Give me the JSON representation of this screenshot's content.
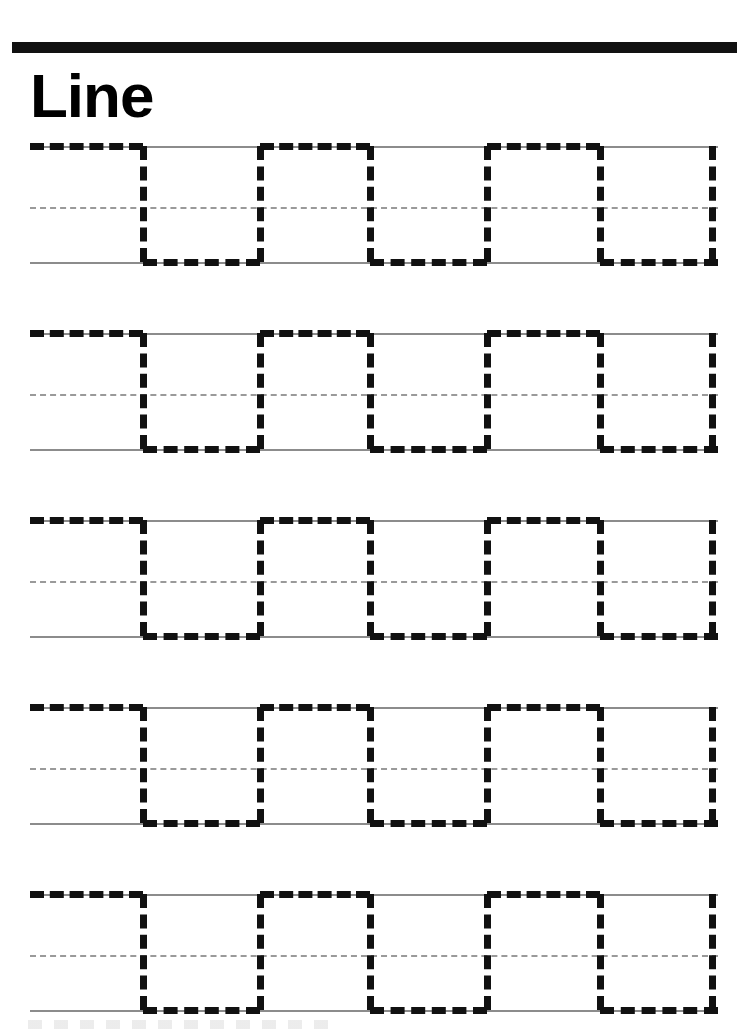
{
  "worksheet": {
    "title": "Line",
    "type": "handwriting-tracing-worksheet",
    "pattern_name": "square-wave-line",
    "page_width": 749,
    "page_height": 1034
  },
  "header": {
    "bar_color": "#111111",
    "title_color": "#000000"
  },
  "guides": {
    "line_color": "#8c8c8c",
    "mid_line_color": "#9a9a9a",
    "left_x": 30,
    "right_x": 718,
    "top_offset": 15,
    "mid_offset": 76,
    "bottom_offset": 131
  },
  "stroke": {
    "color": "#111111",
    "thickness": 7,
    "dash_style": "dashed",
    "period": 117,
    "vertical_positions": [
      143,
      260,
      370,
      487,
      600,
      712
    ]
  },
  "rows": [
    {
      "index": 1,
      "label": "tracing-row-1",
      "top": 131
    },
    {
      "index": 2,
      "label": "tracing-row-2",
      "top": 318
    },
    {
      "index": 3,
      "label": "tracing-row-3",
      "top": 505
    },
    {
      "index": 4,
      "label": "tracing-row-4",
      "top": 692
    },
    {
      "index": 5,
      "label": "tracing-row-5",
      "top": 879
    }
  ],
  "segments": {
    "top_runs": [
      {
        "left": 30,
        "width": 113
      },
      {
        "left": 260,
        "width": 110
      },
      {
        "left": 487,
        "width": 113
      }
    ],
    "bottom_runs": [
      {
        "left": 143,
        "width": 117
      },
      {
        "left": 370,
        "width": 117
      },
      {
        "left": 600,
        "width": 118
      }
    ],
    "verticals": [
      {
        "left": 143
      },
      {
        "left": 260
      },
      {
        "left": 370
      },
      {
        "left": 487
      },
      {
        "left": 600
      },
      {
        "left": 712
      }
    ]
  }
}
